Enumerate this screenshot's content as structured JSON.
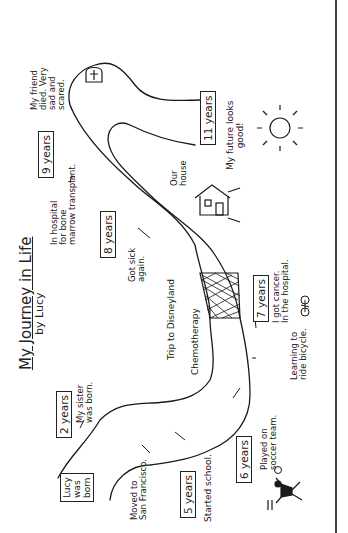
{
  "title": "My Journey in Life",
  "byline": "by Lucy",
  "milestones": [
    {
      "age": "Lucy was born",
      "lines": [
        "Lucy",
        "was",
        "born"
      ]
    },
    {
      "age": "2 years",
      "note_lines": [
        "My sister",
        "was born."
      ]
    },
    {
      "note_lines": [
        "Moved to",
        "San Francisco."
      ]
    },
    {
      "age": "5 years",
      "note_lines": [
        "Started school."
      ]
    },
    {
      "age": "6 years",
      "note_lines": [
        "Played on",
        "soccer team."
      ]
    },
    {
      "note_lines": [
        "Learning to",
        "ride bicycle."
      ]
    },
    {
      "age": "7 years",
      "note_lines": [
        "I got cancer.",
        "In the hospital."
      ]
    },
    {
      "note_lines": [
        "Chemotherapy"
      ]
    },
    {
      "note_lines": [
        "Trip to Disneyland"
      ]
    },
    {
      "age": "8 years",
      "note_lines": [
        "Got sick",
        "again."
      ]
    },
    {
      "note_lines": [
        "Our",
        "house"
      ]
    },
    {
      "age": "9 years",
      "note_lines": [
        "In hospital",
        "for bone",
        "marrow transplant."
      ]
    },
    {
      "note_lines": [
        "My friend",
        "died. Very",
        "sad and",
        "scared."
      ]
    },
    {
      "age": "11 years",
      "note_lines": [
        "My future looks",
        "good!"
      ]
    }
  ],
  "icons": [
    "tombstone-icon",
    "sun-icon",
    "house-icon",
    "bicycle-icon",
    "soccer-player-icon",
    "soccer-ball-icon"
  ],
  "colors": {
    "ink": "#1a1a1a",
    "paper": "#ffffff",
    "border": "#444444"
  }
}
